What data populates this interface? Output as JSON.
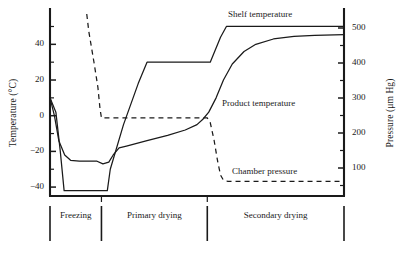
{
  "chart_data": {
    "type": "line",
    "title": "",
    "subtitle": "",
    "xlabel": "",
    "grid": false,
    "legend_position": "inline-annotations",
    "axes": {
      "left": {
        "label": "Temperature (°C)",
        "unit": "°C",
        "ticks": [
          40,
          20,
          0,
          -20,
          -40
        ],
        "tick_labels": [
          "40",
          "20",
          "0",
          "−20",
          "−40"
        ],
        "ylim": [
          -45,
          57
        ],
        "minor_ticks": true
      },
      "right": {
        "label": "Pressure (μm Hg)",
        "unit": "μm Hg",
        "ticks": [
          500,
          400,
          300,
          200,
          100
        ],
        "tick_labels": [
          "500",
          "400",
          "300",
          "200",
          "100"
        ],
        "ylim": [
          20,
          540
        ],
        "minor_ticks": true
      }
    },
    "phases": [
      {
        "name": "Freezing",
        "x_start": 0.0,
        "x_end": 0.175
      },
      {
        "name": "Primary drying",
        "x_start": 0.175,
        "x_end": 0.535
      },
      {
        "name": "Secondary drying",
        "x_start": 0.535,
        "x_end": 1.0
      }
    ],
    "series": [
      {
        "name": "Shelf temperature",
        "axis": "left",
        "style": "solid",
        "color": "#1a1a1a",
        "points": [
          [
            0.0,
            10
          ],
          [
            0.02,
            2
          ],
          [
            0.035,
            -20
          ],
          [
            0.048,
            -42
          ],
          [
            0.175,
            -42
          ],
          [
            0.195,
            -42
          ],
          [
            0.205,
            -30
          ],
          [
            0.25,
            -5
          ],
          [
            0.3,
            18
          ],
          [
            0.33,
            30
          ],
          [
            0.535,
            30
          ],
          [
            0.545,
            30
          ],
          [
            0.58,
            44
          ],
          [
            0.6,
            50
          ],
          [
            1.0,
            50
          ]
        ]
      },
      {
        "name": "Product temperature",
        "axis": "left",
        "style": "solid",
        "color": "#1a1a1a",
        "points": [
          [
            0.0,
            10
          ],
          [
            0.015,
            0
          ],
          [
            0.03,
            -14
          ],
          [
            0.05,
            -22
          ],
          [
            0.07,
            -25
          ],
          [
            0.1,
            -25.5
          ],
          [
            0.16,
            -25.5
          ],
          [
            0.18,
            -27
          ],
          [
            0.2,
            -26
          ],
          [
            0.215,
            -22
          ],
          [
            0.235,
            -18
          ],
          [
            0.26,
            -17
          ],
          [
            0.33,
            -14
          ],
          [
            0.4,
            -11
          ],
          [
            0.46,
            -8
          ],
          [
            0.5,
            -5
          ],
          [
            0.52,
            -2
          ],
          [
            0.54,
            2
          ],
          [
            0.565,
            10
          ],
          [
            0.59,
            20
          ],
          [
            0.62,
            29
          ],
          [
            0.66,
            36
          ],
          [
            0.7,
            40
          ],
          [
            0.76,
            43
          ],
          [
            0.83,
            44.5
          ],
          [
            0.9,
            45
          ],
          [
            1.0,
            45.5
          ]
        ]
      },
      {
        "name": "Chamber pressure",
        "axis": "right",
        "style": "dashed",
        "color": "#1a1a1a",
        "points": [
          [
            0.125,
            540
          ],
          [
            0.132,
            490
          ],
          [
            0.15,
            400
          ],
          [
            0.163,
            330
          ],
          [
            0.17,
            270
          ],
          [
            0.175,
            243
          ],
          [
            0.185,
            243
          ],
          [
            0.535,
            243
          ],
          [
            0.545,
            230
          ],
          [
            0.558,
            180
          ],
          [
            0.57,
            120
          ],
          [
            0.58,
            80
          ],
          [
            0.59,
            65
          ],
          [
            0.605,
            62
          ],
          [
            1.0,
            62
          ]
        ]
      }
    ],
    "annotations": [
      {
        "text": "Shelf temperature",
        "target": "Shelf temperature"
      },
      {
        "text": "Product temperature",
        "target": "Product temperature"
      },
      {
        "text": "Chamber pressure",
        "target": "Chamber pressure"
      }
    ]
  }
}
